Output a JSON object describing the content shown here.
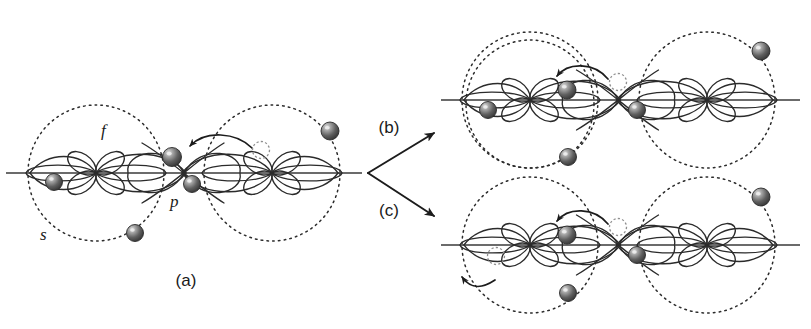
{
  "figure": {
    "background_color": "#ffffff",
    "width": 811,
    "height": 329,
    "stroke_color": "#2b2b2b",
    "axis_color": "#3a3a3a",
    "electron_dark_color": "#4a4a4a",
    "electron_ghost_color": "#d8d8d8"
  },
  "panels": [
    {
      "id": "a",
      "caption": "(a)",
      "caption_x": 186,
      "caption_y": 286,
      "axis_y": 173,
      "axis_x1": 6,
      "axis_x2": 362,
      "atoms": [
        {
          "name": "left-atom",
          "cx": 96,
          "cy": 173,
          "shell_rx": 68,
          "shell_ry": 68
        },
        {
          "name": "right-atom",
          "cx": 272,
          "cy": 173,
          "shell_rx": 68,
          "shell_ry": 68
        }
      ],
      "orbital_labels": [
        {
          "name": "f",
          "text": "f",
          "x": 101,
          "y": 136
        },
        {
          "name": "p",
          "text": "p",
          "x": 170,
          "y": 207
        },
        {
          "name": "s",
          "text": "s",
          "x": 40,
          "y": 240
        }
      ],
      "electrons": [
        {
          "name": "electron-left-inner",
          "cx": 54,
          "cy": 182,
          "r": 8.5,
          "state": "solid"
        },
        {
          "name": "electron-left-lower",
          "cx": 135,
          "cy": 233,
          "r": 8.5,
          "state": "solid"
        },
        {
          "name": "electron-bond-upper",
          "cx": 172,
          "cy": 157,
          "r": 9.5,
          "state": "solid"
        },
        {
          "name": "electron-bond-lower",
          "cx": 192,
          "cy": 184,
          "r": 8.5,
          "state": "solid"
        },
        {
          "name": "electron-ghost-right",
          "cx": 261,
          "cy": 150,
          "r": 8.5,
          "state": "ghost"
        },
        {
          "name": "electron-right-outer",
          "cx": 330,
          "cy": 131,
          "r": 9.0,
          "state": "solid"
        }
      ],
      "transfer_arrows": [
        {
          "name": "electron-transfer-arrow",
          "path": "M 252 148 C 236 132 205 130 190 146",
          "direction": "leftward"
        }
      ]
    },
    {
      "id": "b",
      "caption": "(b)",
      "caption_x": 389,
      "caption_y": 133,
      "axis_y": 100,
      "axis_x1": 441,
      "axis_x2": 800,
      "atoms": [
        {
          "name": "left-atom",
          "cx": 530,
          "cy": 100,
          "shell_rx": 68,
          "shell_ry": 68
        },
        {
          "name": "right-atom",
          "cx": 707,
          "cy": 100,
          "shell_rx": 68,
          "shell_ry": 68
        },
        {
          "name": "left-atom-shell-lower",
          "cx": 530,
          "cy": 104,
          "shell_rx": 64,
          "shell_ry": 64
        }
      ],
      "electrons": [
        {
          "name": "electron-left-inner",
          "cx": 488,
          "cy": 110,
          "r": 8.5,
          "state": "solid"
        },
        {
          "name": "electron-captured",
          "cx": 567,
          "cy": 90,
          "r": 9.0,
          "state": "solid"
        },
        {
          "name": "electron-ghost-bond",
          "cx": 618,
          "cy": 82,
          "r": 8.5,
          "state": "ghost"
        },
        {
          "name": "electron-bond-lower",
          "cx": 637,
          "cy": 110,
          "r": 8.5,
          "state": "solid"
        },
        {
          "name": "electron-left-lower",
          "cx": 568,
          "cy": 157,
          "r": 8.5,
          "state": "solid"
        },
        {
          "name": "electron-right-outer",
          "cx": 761,
          "cy": 51,
          "r": 9.0,
          "state": "solid"
        }
      ],
      "transfer_arrows": [
        {
          "name": "electron-transfer-arrow",
          "path": "M 608 79 C 594 62 568 62 557 76",
          "direction": "leftward"
        }
      ]
    },
    {
      "id": "c",
      "caption": "(c)",
      "caption_x": 389,
      "caption_y": 216,
      "axis_y": 245,
      "axis_x1": 441,
      "axis_x2": 800,
      "atoms": [
        {
          "name": "left-atom",
          "cx": 530,
          "cy": 245,
          "shell_rx": 68,
          "shell_ry": 68
        },
        {
          "name": "right-atom",
          "cx": 707,
          "cy": 245,
          "shell_rx": 68,
          "shell_ry": 68
        }
      ],
      "electrons": [
        {
          "name": "electron-ghost-ejected",
          "cx": 496,
          "cy": 256,
          "r": 8.5,
          "state": "ghost"
        },
        {
          "name": "electron-captured",
          "cx": 567,
          "cy": 235,
          "r": 9.0,
          "state": "solid"
        },
        {
          "name": "electron-ghost-bond",
          "cx": 618,
          "cy": 227,
          "r": 8.5,
          "state": "ghost"
        },
        {
          "name": "electron-bond-lower",
          "cx": 637,
          "cy": 255,
          "r": 8.5,
          "state": "solid"
        },
        {
          "name": "electron-left-lower",
          "cx": 568,
          "cy": 293,
          "r": 8.5,
          "state": "solid"
        },
        {
          "name": "electron-right-outer",
          "cx": 761,
          "cy": 197,
          "r": 9.0,
          "state": "solid"
        }
      ],
      "transfer_arrows": [
        {
          "name": "electron-transfer-arrow",
          "path": "M 608 224 C 594 207 568 207 557 221",
          "direction": "leftward"
        },
        {
          "name": "electron-ejection-arrow",
          "path": "M 495 280 C 480 290 470 288 462 277",
          "direction": "outward-left"
        }
      ]
    }
  ],
  "flow_arrows": [
    {
      "name": "flow-arrow-to-b",
      "x1": 368,
      "y1": 173,
      "x2": 434,
      "y2": 133,
      "target_panel": "b"
    },
    {
      "name": "flow-arrow-to-c",
      "x1": 368,
      "y1": 173,
      "x2": 434,
      "y2": 216,
      "target_panel": "c"
    }
  ]
}
